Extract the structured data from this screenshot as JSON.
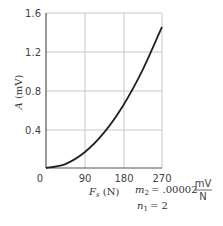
{
  "chart_data": {
    "type": "line",
    "title": "",
    "xlabel": "F_s (N)",
    "ylabel": "A (mV)",
    "xlim": [
      0,
      270
    ],
    "ylim": [
      0,
      1.6
    ],
    "x_ticks": [
      "0",
      "90",
      "180",
      "270"
    ],
    "y_ticks": [
      "0.4",
      "0.8",
      "1.2",
      "1.6"
    ],
    "grid": true,
    "series": [
      {
        "name": "A = m2 * Fs^n1",
        "x": [
          0,
          45,
          90,
          135,
          180,
          225,
          270
        ],
        "values": [
          0,
          0.0405,
          0.162,
          0.3645,
          0.648,
          1.0125,
          1.458
        ]
      }
    ],
    "annotations": {
      "m2_label": "m",
      "m2_sub": "2",
      "m2_value": "= .00002",
      "m2_unit_num": "mV",
      "m2_unit_den": "N",
      "n1_label": "n",
      "n1_sub": "1",
      "n1_value": "= 2"
    }
  },
  "labels": {
    "y_axis_main": "A",
    "y_axis_unit": " (mV)",
    "x_axis_main": "F",
    "x_axis_sub": "s",
    "x_axis_unit": " (N)",
    "origin": "0",
    "x90": "90",
    "x180": "180",
    "x270": "270",
    "y04": "0.4",
    "y08": "0.8",
    "y12": "1.2",
    "y16": "1.6"
  }
}
